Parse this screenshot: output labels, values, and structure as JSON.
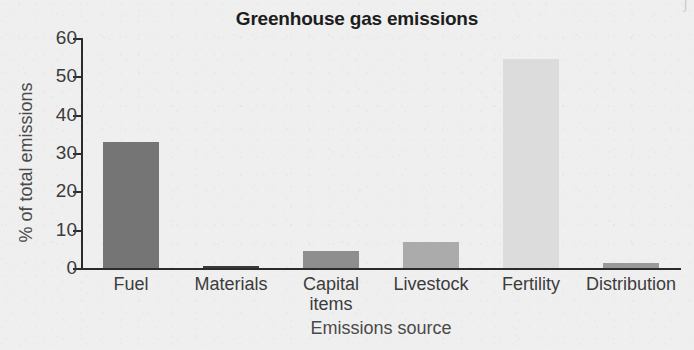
{
  "figure": {
    "background_color": "#efefef",
    "axis_color": "#2b2b2b",
    "corner_artifact": "ʃ"
  },
  "chart_data": {
    "type": "bar",
    "title": "Greenhouse gas emissions",
    "xlabel": "Emissions source",
    "ylabel": "% of total emissions",
    "categories": [
      "Fuel",
      "Materials",
      "Capital items",
      "Livestock",
      "Fertility",
      "Distribution"
    ],
    "category_lines": [
      [
        "Fuel"
      ],
      [
        "Materials"
      ],
      [
        "Capital",
        "items"
      ],
      [
        "Livestock"
      ],
      [
        "Fertility"
      ],
      [
        "Distribution"
      ]
    ],
    "values": [
      33.0,
      0.5,
      4.5,
      6.7,
      54.5,
      1.2
    ],
    "bar_colors": [
      "#757575",
      "#3a3a3a",
      "#8e8e8e",
      "#ababab",
      "#dcdcdc",
      "#9a9a9a"
    ],
    "ylim": [
      0,
      60
    ],
    "yticks": [
      0,
      10,
      20,
      30,
      40,
      50,
      60
    ],
    "ytick_labels": [
      "0",
      "10",
      "20",
      "30",
      "40",
      "50",
      "60"
    ],
    "grid": false,
    "legend": false
  }
}
